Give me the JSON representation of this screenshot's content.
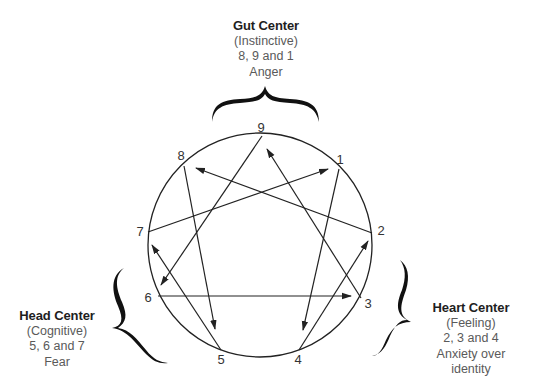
{
  "diagram": {
    "type": "enneagram",
    "colors": {
      "stroke": "#222222",
      "label": "#333333",
      "title": "#1e1e1e",
      "subtitle": "#5a5a5a"
    },
    "points": [
      {
        "id": "9",
        "label": "9"
      },
      {
        "id": "1",
        "label": "1"
      },
      {
        "id": "2",
        "label": "2"
      },
      {
        "id": "3",
        "label": "3"
      },
      {
        "id": "4",
        "label": "4"
      },
      {
        "id": "5",
        "label": "5"
      },
      {
        "id": "6",
        "label": "6"
      },
      {
        "id": "7",
        "label": "7"
      },
      {
        "id": "8",
        "label": "8"
      }
    ],
    "arrows": [
      {
        "from": "9",
        "to": "6"
      },
      {
        "from": "6",
        "to": "3"
      },
      {
        "from": "3",
        "to": "9"
      },
      {
        "from": "1",
        "to": "4"
      },
      {
        "from": "4",
        "to": "2"
      },
      {
        "from": "2",
        "to": "8"
      },
      {
        "from": "8",
        "to": "5"
      },
      {
        "from": "5",
        "to": "7"
      },
      {
        "from": "7",
        "to": "1"
      }
    ]
  },
  "centers": {
    "gut": {
      "title": "Gut Center",
      "subtitle": "(Instinctive)",
      "types": "8, 9 and 1",
      "emotion": "Anger"
    },
    "head": {
      "title": "Head Center",
      "subtitle": "(Cognitive)",
      "types": "5, 6 and 7",
      "emotion": "Fear"
    },
    "heart": {
      "title": "Heart Center",
      "subtitle": "(Feeling)",
      "types": "2, 3 and 4",
      "emotion_line1": "Anxiety over",
      "emotion_line2": "identity"
    }
  }
}
